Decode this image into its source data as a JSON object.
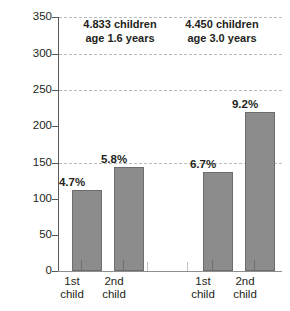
{
  "chart_data": {
    "type": "bar",
    "title": "",
    "xlabel": "",
    "ylabel": "",
    "ylim": [
      0,
      350
    ],
    "yticks": [
      0,
      50,
      100,
      150,
      200,
      250,
      300,
      350
    ],
    "ytick_labels": [
      "0",
      "50",
      "100",
      "150",
      "200",
      "250",
      "300",
      "350"
    ],
    "gridlines": [
      150,
      250,
      300
    ],
    "grid": "dashed horizontal at 150, 250, 300",
    "legend": "none",
    "bar_color": "#8c8c8c",
    "bar_border_color": "#6c6d6f",
    "axis_color": "#58595b",
    "gridline_color": "#b9bbbd",
    "categories": [
      "1st child",
      "2nd child",
      "1st child",
      "2nd child"
    ],
    "values": [
      112,
      143,
      137,
      219
    ],
    "data_labels": [
      "4.7%",
      "5.8%",
      "6.7%",
      "9.2%"
    ],
    "groups": [
      {
        "note_line1": "4.833 children",
        "note_line2": "age 1.6 years",
        "bars": [
          {
            "category_line1": "1st",
            "category_line2": "child",
            "value": 112,
            "label": "4.7%"
          },
          {
            "category_line1": "2nd",
            "category_line2": "child",
            "value": 143,
            "label": "5.8%"
          }
        ]
      },
      {
        "note_line1": "4.450 children",
        "note_line2": "age 3.0 years",
        "bars": [
          {
            "category_line1": "1st",
            "category_line2": "child",
            "value": 137,
            "label": "6.7%"
          },
          {
            "category_line1": "2nd",
            "category_line2": "child",
            "value": 219,
            "label": "9.2%"
          }
        ]
      }
    ]
  }
}
